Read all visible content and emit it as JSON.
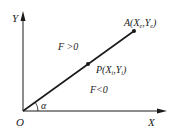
{
  "diagram": {
    "axes": {
      "x_label": "X",
      "y_label": "Y",
      "origin_label": "O"
    },
    "line": {
      "end_point_label": "A(X",
      "end_point_sub_x": "e",
      "end_point_sep": ",Y",
      "end_point_sub_y": "e",
      "end_point_close": ")",
      "mid_point_label": "P(X",
      "mid_point_sub_x": "i",
      "mid_point_sep": ",Y",
      "mid_point_sub_y": "i",
      "mid_point_close": ")",
      "angle_label": "α"
    },
    "regions": {
      "above": "F >0",
      "below": "F<0"
    },
    "colors": {
      "stroke": "#1a1a1a",
      "text": "#222222"
    }
  }
}
